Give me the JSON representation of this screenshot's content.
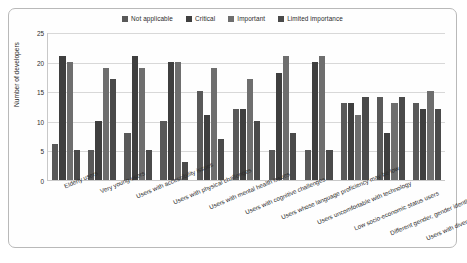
{
  "chart_data": {
    "type": "bar",
    "title": "",
    "xlabel": "",
    "ylabel": "Number of developers",
    "ylim": [
      0,
      25
    ],
    "yticks": [
      0,
      5,
      10,
      15,
      20,
      25
    ],
    "grid": true,
    "legend_position": "top-center",
    "categories": [
      "Elderly users",
      "Very young users",
      "Users with accessibility issues",
      "Users with physical challenges",
      "Users with mental health issues",
      "Users with cognitive challenges",
      "Users whose language proficiency may be low",
      "Users uncomfortable with technology",
      "Low socio-economic status users",
      "Different gender, gender identity of users",
      "Users with diverse cultural backgrounds"
    ],
    "series": [
      {
        "name": "Not applicable",
        "color": "#595959",
        "values": [
          6,
          5,
          8,
          10,
          15,
          12,
          5,
          5,
          13,
          14,
          13
        ]
      },
      {
        "name": "Critical",
        "color": "#3f3f3f",
        "values": [
          21,
          10,
          21,
          20,
          11,
          12,
          18,
          20,
          13,
          8,
          12
        ]
      },
      {
        "name": "Important",
        "color": "#6e6e6e",
        "values": [
          20,
          19,
          19,
          20,
          19,
          17,
          21,
          21,
          11,
          13,
          15
        ]
      },
      {
        "name": "Limited importance",
        "color": "#4a4a4a",
        "values": [
          5,
          17,
          5,
          3,
          7,
          10,
          8,
          5,
          14,
          14,
          12
        ]
      }
    ]
  }
}
